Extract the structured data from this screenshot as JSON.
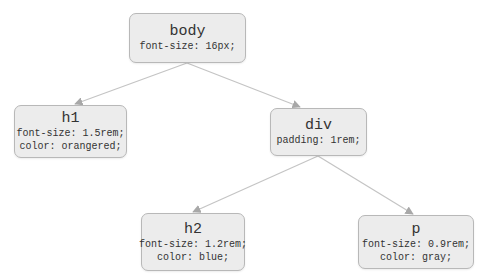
{
  "diagram": {
    "type": "tree",
    "edge_color": "#c0c0c0",
    "node_fill": "#ececec",
    "node_border": "#b8b8b8",
    "nodes": {
      "body": {
        "tag": "body",
        "rules": [
          "font-size: 16px;"
        ]
      },
      "h1": {
        "tag": "h1",
        "rules": [
          "font-size: 1.5rem;",
          "color: orangered;"
        ]
      },
      "div": {
        "tag": "div",
        "rules": [
          "padding: 1rem;"
        ]
      },
      "h2": {
        "tag": "h2",
        "rules": [
          "font-size: 1.2rem;",
          "color: blue;"
        ]
      },
      "p": {
        "tag": "p",
        "rules": [
          "font-size: 0.9rem;",
          "color: gray;"
        ]
      }
    },
    "edges": [
      {
        "from": "body",
        "to": "h1"
      },
      {
        "from": "body",
        "to": "div"
      },
      {
        "from": "div",
        "to": "h2"
      },
      {
        "from": "div",
        "to": "p"
      }
    ]
  }
}
